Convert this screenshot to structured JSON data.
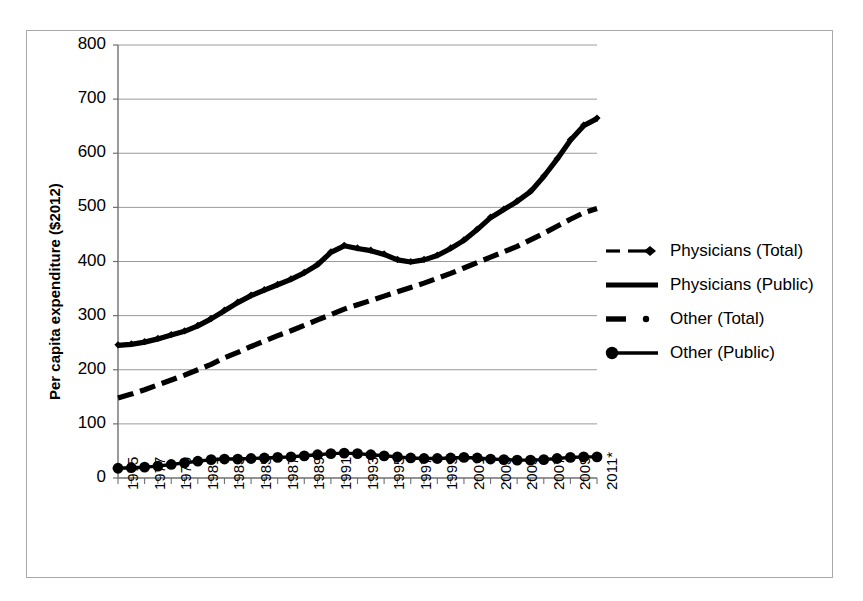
{
  "chart_data": {
    "type": "line",
    "title": "",
    "subtitle": "",
    "xlabel": "",
    "ylabel": "Per capita expenditure ($2012)",
    "ylim": [
      0,
      800
    ],
    "ytick_values": [
      0,
      100,
      200,
      300,
      400,
      500,
      600,
      700,
      800
    ],
    "ytick_labels": [
      "0",
      "100",
      "200",
      "300",
      "400",
      "500",
      "600",
      "700",
      "800"
    ],
    "grid": "horizontal",
    "legend_position": "right",
    "x": [
      1975,
      1976,
      1977,
      1978,
      1979,
      1980,
      1981,
      1982,
      1983,
      1984,
      1985,
      1986,
      1987,
      1988,
      1989,
      1990,
      1991,
      1992,
      1993,
      1994,
      1995,
      1996,
      1997,
      1998,
      1999,
      2000,
      2001,
      2002,
      2003,
      2004,
      2005,
      2006,
      2007,
      2008,
      2009,
      2010,
      2011
    ],
    "xtick_labels": [
      "1975",
      "",
      "1977",
      "",
      "1979",
      "",
      "1981",
      "",
      "1983",
      "",
      "1985",
      "",
      "1987",
      "",
      "1989",
      "",
      "1991",
      "",
      "1993",
      "",
      "1995",
      "",
      "1997",
      "",
      "1999",
      "",
      "2001",
      "",
      "2003",
      "",
      "2005",
      "",
      "2007",
      "",
      "2009",
      "",
      "2011*"
    ],
    "xtick_labels_shown": [
      "1975",
      "1977",
      "1979",
      "1981",
      "1983",
      "1985",
      "1987",
      "1989",
      "1991",
      "1993",
      "1995",
      "1997",
      "1999",
      "2001",
      "2003",
      "2005",
      "2007",
      "2009",
      "2011*"
    ],
    "footnote_marker": "*",
    "series": [
      {
        "name": "Physicians (Total)",
        "style": "dashed",
        "marker": "diamond",
        "color": "#000000",
        "values": [
          246,
          248,
          252,
          258,
          265,
          272,
          282,
          295,
          310,
          325,
          338,
          348,
          358,
          368,
          380,
          395,
          418,
          430,
          425,
          421,
          414,
          404,
          400,
          404,
          412,
          425,
          440,
          460,
          482,
          497,
          512,
          530,
          558,
          590,
          625,
          652,
          665
        ]
      },
      {
        "name": "Physicians (Public)",
        "style": "solid",
        "marker": "none",
        "color": "#000000",
        "values": [
          245,
          247,
          251,
          257,
          264,
          271,
          281,
          294,
          309,
          324,
          337,
          347,
          357,
          367,
          379,
          394,
          417,
          429,
          424,
          420,
          413,
          403,
          399,
          403,
          411,
          424,
          439,
          459,
          481,
          496,
          511,
          529,
          557,
          589,
          624,
          651,
          664
        ]
      },
      {
        "name": "Other (Total)",
        "style": "dashed",
        "marker": "dot",
        "color": "#000000",
        "values": [
          148,
          155,
          163,
          172,
          181,
          190,
          200,
          210,
          222,
          232,
          243,
          253,
          263,
          272,
          282,
          292,
          302,
          312,
          320,
          328,
          336,
          344,
          352,
          360,
          369,
          378,
          388,
          398,
          408,
          418,
          428,
          440,
          452,
          465,
          478,
          490,
          498
        ]
      },
      {
        "name": "Other (Public)",
        "style": "solid",
        "marker": "circle",
        "color": "#000000",
        "values": [
          18,
          19,
          20,
          22,
          25,
          28,
          31,
          34,
          35,
          35,
          36,
          37,
          38,
          39,
          41,
          43,
          45,
          46,
          45,
          43,
          41,
          39,
          37,
          36,
          36,
          37,
          38,
          37,
          35,
          34,
          33,
          33,
          34,
          36,
          38,
          39,
          39
        ]
      }
    ]
  },
  "axis": {
    "y_title": "Per capita expenditure ($2012)"
  },
  "legend": {
    "items": [
      {
        "label": "Physicians (Total)",
        "key": "dashed-diamond-key"
      },
      {
        "label": "Physicians (Public)",
        "key": "solid-thick-key"
      },
      {
        "label": "Other (Total)",
        "key": "dashed-dot-key"
      },
      {
        "label": "Other (Public)",
        "key": "solid-circle-key"
      }
    ]
  },
  "colors": {
    "line": "#000000",
    "grid": "#9a9a9a",
    "axis": "#707070",
    "frame": "#a9a9a9",
    "background": "#ffffff"
  }
}
